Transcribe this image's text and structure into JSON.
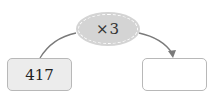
{
  "operation": {
    "label": "×3",
    "fill": "#d4d4d4"
  },
  "input_box": {
    "value": "417",
    "fill": "#ececec"
  },
  "output_box": {
    "value": ""
  },
  "colors": {
    "arrow": "#7a7a7a",
    "box_border": "#b8b8b8"
  }
}
